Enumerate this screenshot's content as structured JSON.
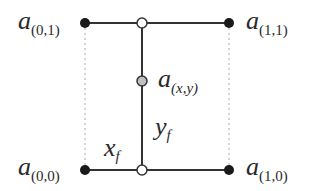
{
  "diagram": {
    "type": "bilinear-interpolation",
    "colors": {
      "line": "#333333",
      "dotted": "#c8c8c8",
      "corner_fill": "#1a1a1a",
      "open_fill": "#ffffff",
      "interp_fill": "#c0c0c0"
    },
    "nodes": {
      "top_left": {
        "base": "a",
        "sub": "(0,1)"
      },
      "top_right": {
        "base": "a",
        "sub": "(1,1)"
      },
      "bottom_left": {
        "base": "a",
        "sub": "(0,0)"
      },
      "bottom_right": {
        "base": "a",
        "sub": "(1,0)"
      },
      "interp": {
        "base": "a",
        "sub": "(x,y)"
      }
    },
    "fractions": {
      "x": {
        "base": "x",
        "sub": "f"
      },
      "y": {
        "base": "y",
        "sub": "f"
      }
    }
  }
}
